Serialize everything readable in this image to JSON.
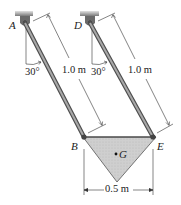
{
  "figure": {
    "labels": {
      "A": "A",
      "D": "D",
      "B": "B",
      "E": "E",
      "G": "G"
    },
    "angles": {
      "left": "30°",
      "right": "30°"
    },
    "dimensions": {
      "rod_AB_length": "1.0 m",
      "rod_DE_length": "1.0 m",
      "width_BE": "0.5 m"
    },
    "colors": {
      "plate_fill": "#c9c9c9",
      "rod": "#8a8a8a",
      "support": "#6e6e6e",
      "line": "#333333"
    }
  }
}
